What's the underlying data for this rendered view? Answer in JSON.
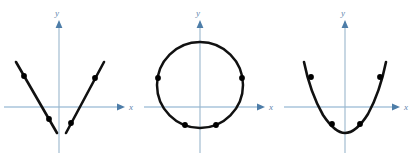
{
  "figure": {
    "panel_count": 3,
    "axis_color": "#7fa8c9",
    "curve_color": "#111111",
    "point_color": "#000000",
    "background": "#ffffff",
    "axis_labels": {
      "x": "x",
      "y": "y"
    }
  },
  "panels": [
    {
      "id": "panel-left",
      "name": "v-shaped-branches",
      "curve_type": "two-linear-branches",
      "x_label": "x",
      "y_label": "y",
      "origin": {
        "x": 59,
        "y": 107
      },
      "points": [
        {
          "x": 24,
          "y": 77
        },
        {
          "x": 49,
          "y": 125
        },
        {
          "x": 70,
          "y": 125
        },
        {
          "x": 95,
          "y": 77
        }
      ]
    },
    {
      "id": "panel-middle",
      "name": "circle",
      "curve_type": "circle",
      "x_label": "x",
      "y_label": "y",
      "origin": {
        "x": 200,
        "y": 107
      },
      "center": {
        "x": 200,
        "y": 85
      },
      "radius": 43,
      "points": [
        {
          "x": 170,
          "y": 78
        },
        {
          "x": 231,
          "y": 78
        },
        {
          "x": 186,
          "y": 123
        },
        {
          "x": 215,
          "y": 123
        }
      ]
    },
    {
      "id": "panel-right",
      "name": "parabola",
      "curve_type": "parabola",
      "x_label": "x",
      "y_label": "y",
      "origin": {
        "x": 345,
        "y": 107
      },
      "points": [
        {
          "x": 311,
          "y": 77
        },
        {
          "x": 332,
          "y": 124
        },
        {
          "x": 360,
          "y": 124
        },
        {
          "x": 381,
          "y": 77
        }
      ]
    }
  ]
}
